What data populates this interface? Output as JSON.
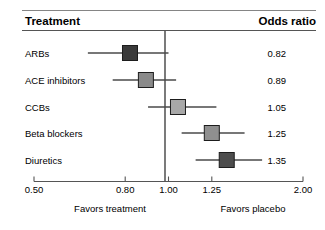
{
  "header": {
    "treatment_label": "Treatment",
    "odds_ratio_label": "Odds ratio"
  },
  "footer": {
    "left_label": "Favors treatment",
    "right_label": "Favors placebo"
  },
  "chart_data": {
    "type": "scatter",
    "plot_kind": "forest-plot",
    "title": "",
    "xlabel": "",
    "ylabel": "",
    "xscale": "log",
    "xlim": [
      0.5,
      2.0
    ],
    "null_value": 1.0,
    "grid": false,
    "legend": "none",
    "tick_values": [
      0.5,
      0.8,
      1.0,
      1.25,
      2.0
    ],
    "tick_labels": [
      "0.50",
      "0.80",
      "1.00",
      "1.25",
      "2.00"
    ],
    "categories": [
      "ARBs",
      "ACE inhibitors",
      "CCBs",
      "Beta blockers",
      "Diuretics"
    ],
    "values": [
      0.82,
      0.89,
      1.05,
      1.25,
      1.35
    ],
    "value_labels": [
      "0.82",
      "0.89",
      "1.05",
      "1.25",
      "1.35"
    ],
    "ci_low": [
      0.66,
      0.75,
      0.9,
      1.07,
      1.15
    ],
    "ci_high": [
      1.0,
      1.04,
      1.28,
      1.48,
      1.62
    ],
    "marker_colors": [
      "#3a3a3a",
      "#8a8a8a",
      "#a8a8a8",
      "#8f8f8f",
      "#4d4d4d"
    ],
    "rows": [
      {
        "label": "ARBs",
        "or": 0.82,
        "or_text": "0.82",
        "low": 0.66,
        "high": 1.0,
        "color": "#3a3a3a"
      },
      {
        "label": "ACE inhibitors",
        "or": 0.89,
        "or_text": "0.89",
        "low": 0.75,
        "high": 1.04,
        "color": "#8a8a8a"
      },
      {
        "label": "CCBs",
        "or": 1.05,
        "or_text": "1.05",
        "low": 0.9,
        "high": 1.28,
        "color": "#a8a8a8"
      },
      {
        "label": "Beta blockers",
        "or": 1.25,
        "or_text": "1.25",
        "low": 1.07,
        "high": 1.48,
        "color": "#8f8f8f"
      },
      {
        "label": "Diuretics",
        "or": 1.35,
        "or_text": "1.35",
        "low": 1.15,
        "high": 1.62,
        "color": "#4d4d4d"
      }
    ]
  }
}
